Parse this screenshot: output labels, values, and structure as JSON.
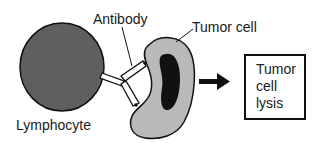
{
  "labels": {
    "antibody": "Antibody",
    "tumor_cell": "Tumor cell",
    "lymphocyte": "Lymphocyte"
  },
  "result_box": {
    "lines": [
      "Tumor",
      "cell",
      "lysis"
    ]
  },
  "colors": {
    "lymphocyte_fill": "#5f5f5f",
    "tumor_cell_fill": "#b9b9b9",
    "nucleus_fill": "#111111",
    "outline": "#111111",
    "antibody_fill": "#ffffff"
  }
}
